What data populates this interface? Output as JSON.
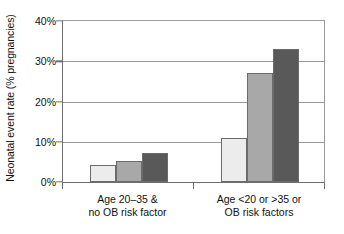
{
  "chart_data": {
    "type": "bar",
    "title": "",
    "xlabel": "",
    "ylabel": "Neonatal event rate (% pregnancies)",
    "ylim": [
      0,
      40
    ],
    "yticks": [
      "0%",
      "10%",
      "20%",
      "30%",
      "40%"
    ],
    "ytick_values": [
      0,
      10,
      20,
      30,
      40
    ],
    "grid": true,
    "legend": "none",
    "categories": [
      "Age 20–35 &\nno OB risk factor",
      "Age <20 or >35 or\nOB risk factors"
    ],
    "category_lines": [
      [
        "Age 20–35 &",
        "no OB risk factor"
      ],
      [
        "Age <20 or >35 or",
        "OB risk factors"
      ]
    ],
    "series": [
      {
        "name": "series-1",
        "color": "#ececec",
        "values": [
          4.2,
          11.0
        ]
      },
      {
        "name": "series-2",
        "color": "#a8a8a8",
        "values": [
          5.2,
          27.0
        ]
      },
      {
        "name": "series-3",
        "color": "#595959",
        "values": [
          7.3,
          33.0
        ]
      }
    ],
    "bar_border_color": "#6b6b6b",
    "axis_color": "#6e6e6e",
    "gridline_color": "#9a9a9a",
    "background": "#ffffff"
  }
}
